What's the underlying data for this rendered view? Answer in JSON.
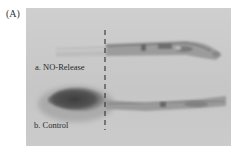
{
  "figure": {
    "panel_label": "(A)",
    "samples": [
      {
        "id": "a",
        "label": "a. NO-Release"
      },
      {
        "id": "b",
        "label": "b. Control"
      }
    ],
    "colors": {
      "background": "#c9c9c9",
      "specimen_light": "#b5b5b5",
      "specimen_dark": "#555555",
      "text": "#2a2a2a"
    }
  }
}
